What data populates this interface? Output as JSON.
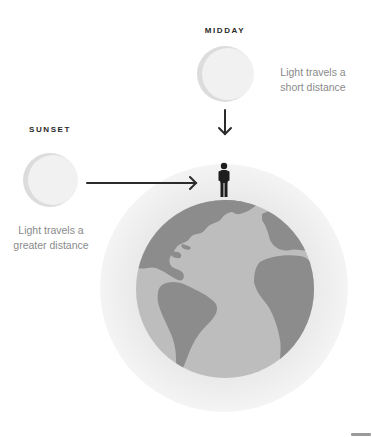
{
  "midday": {
    "label": "MIDDAY",
    "caption_line1": "Light travels a",
    "caption_line2": "short distance"
  },
  "sunset": {
    "label": "SUNSET",
    "caption_line1": "Light travels a",
    "caption_line2": "greater distance"
  },
  "colors": {
    "atmosphere": "#ececec",
    "ocean": "#bdbdbd",
    "land": "#8c8c8c",
    "sun": "#f1f1f1",
    "sun_shade": "#dcdcdc",
    "arrow": "#2b2b2b",
    "person": "#1e1e1e",
    "heading_text": "#2a2a2a",
    "caption_text": "#8a8a8a"
  }
}
